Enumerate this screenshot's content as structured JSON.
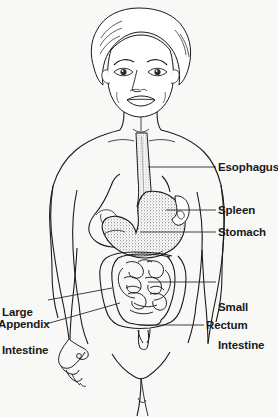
{
  "diagram": {
    "style": "black and white line drawing with stippled organs",
    "colors": {
      "background": "#f8f8f7",
      "ink": "#1a1a1a",
      "leader_line": "#2a2a2a",
      "stipple": "#3a3a3a"
    }
  },
  "labels": [
    {
      "id": "esophagus",
      "text": "Esophagus",
      "lines": [
        "Esophagus"
      ],
      "side": "right",
      "x": 218,
      "y": 161,
      "leader": {
        "x1": 148,
        "y1": 167,
        "x2": 216,
        "y2": 167
      }
    },
    {
      "id": "spleen",
      "text": "Spleen",
      "lines": [
        "Spleen"
      ],
      "side": "right",
      "x": 218,
      "y": 204,
      "leader": {
        "x1": 166,
        "y1": 210,
        "x2": 216,
        "y2": 210
      }
    },
    {
      "id": "stomach",
      "text": "Stomach",
      "lines": [
        "Stomach"
      ],
      "side": "right",
      "x": 218,
      "y": 226,
      "leader": {
        "x1": 140,
        "y1": 232,
        "x2": 216,
        "y2": 232
      }
    },
    {
      "id": "small-intestine",
      "text": "Small Intestine",
      "lines": [
        "Small",
        "Intestine"
      ],
      "side": "right",
      "x": 218,
      "y": 276,
      "leader": {
        "x1": 148,
        "y1": 282,
        "x2": 216,
        "y2": 282
      }
    },
    {
      "id": "rectum",
      "text": "Rectum",
      "lines": [
        "Rectum"
      ],
      "side": "right",
      "x": 206,
      "y": 319,
      "leader": {
        "x1": 139,
        "y1": 325,
        "x2": 204,
        "y2": 325
      }
    },
    {
      "id": "large-intestine",
      "text": "Large Intestine",
      "lines": [
        "Large",
        "Intestine"
      ],
      "side": "left",
      "x": 2,
      "y": 281,
      "leader": {
        "x1": 48,
        "y1": 300,
        "x2": 112,
        "y2": 288
      }
    },
    {
      "id": "appendix",
      "text": "Appendix",
      "lines": [
        "Appendix"
      ],
      "side": "left",
      "x": -2,
      "y": 318,
      "leader": {
        "x1": 46,
        "y1": 324,
        "x2": 120,
        "y2": 303
      }
    }
  ]
}
